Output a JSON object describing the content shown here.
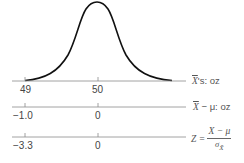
{
  "figure": {
    "type": "normal-distribution-scales",
    "colors": {
      "curve": "#111111",
      "axis": "#8a8a8a",
      "text": "#444444"
    }
  },
  "curve": {
    "description": "normal density curve of sample means",
    "center_value": "50"
  },
  "axes": [
    {
      "id": "xbar",
      "label_var": "X",
      "label_suffix": "'s: oz",
      "ticks": [
        {
          "value": "49"
        },
        {
          "value": "50"
        }
      ]
    },
    {
      "id": "deviation",
      "label_var": "X",
      "label_suffix": " − μ: oz",
      "ticks": [
        {
          "value": "−1.0"
        },
        {
          "value": "0"
        }
      ]
    },
    {
      "id": "z",
      "label_prefix": "Z = ",
      "numerator": "X − μ",
      "denominator_sigma": "σ",
      "denominator_sub": "X̄",
      "ticks": [
        {
          "value": "−3.3"
        },
        {
          "value": "0"
        }
      ]
    }
  ]
}
